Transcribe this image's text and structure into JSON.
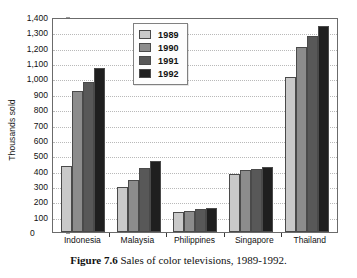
{
  "chart_data": {
    "type": "bar",
    "title": "",
    "xlabel": "",
    "ylabel": "Thousands sold",
    "ylim": [
      0,
      1400
    ],
    "ytick_step": 100,
    "grid": true,
    "legend_position": "top-center",
    "categories": [
      "Indonesia",
      "Malaysia",
      "Philippines",
      "Singapore",
      "Thailand"
    ],
    "ytick_labels": [
      "1,400",
      "1,300",
      "1,200",
      "1,100",
      "1,000",
      "900",
      "800",
      "700",
      "600",
      "500",
      "400",
      "300",
      "200",
      "100",
      "0"
    ],
    "series": [
      {
        "name": "1989",
        "color": "#c9c9c9",
        "values": [
          430,
          290,
          132,
          375,
          1010
        ]
      },
      {
        "name": "1990",
        "color": "#8c8c8c",
        "values": [
          920,
          340,
          140,
          405,
          1205
        ]
      },
      {
        "name": "1991",
        "color": "#585858",
        "values": [
          980,
          415,
          150,
          410,
          1275
        ]
      },
      {
        "name": "1992",
        "color": "#1f1f1f",
        "values": [
          1065,
          460,
          158,
          425,
          1340
        ]
      }
    ]
  },
  "caption": {
    "figure_number": "Figure 7.6",
    "text": " Sales of color televisions, 1989-1992."
  }
}
